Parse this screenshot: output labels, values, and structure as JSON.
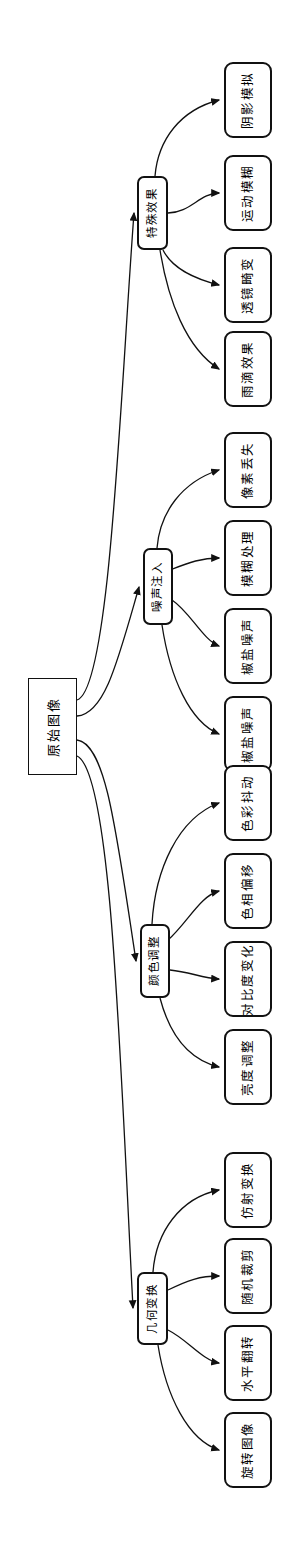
{
  "diagram": {
    "orientation": "rotated-90-ccw",
    "stroke_color": "#111111",
    "fill_color": "#ffffff",
    "root": {
      "id": "root",
      "label": "原始图像",
      "shape": "rectangle",
      "x": 28,
      "y": 678,
      "w": 49,
      "h": 97
    },
    "categories": [
      {
        "id": "cat-special-effects",
        "label": "特殊效果",
        "shape": "rounded-rectangle",
        "x": 137,
        "y": 176,
        "w": 31,
        "h": 74,
        "children": [
          {
            "id": "leaf-shadow-simulation",
            "label": "阴影模拟",
            "x": 224,
            "y": 62,
            "w": 48,
            "h": 76
          },
          {
            "id": "leaf-motion-blur",
            "label": "运动模糊",
            "x": 224,
            "y": 155,
            "w": 48,
            "h": 76
          },
          {
            "id": "leaf-lens-distortion",
            "label": "透镜畸变",
            "x": 224,
            "y": 247,
            "w": 48,
            "h": 76
          },
          {
            "id": "leaf-rain-effect",
            "label": "雨滴效果",
            "x": 224,
            "y": 331,
            "w": 48,
            "h": 76
          }
        ]
      },
      {
        "id": "cat-noise-injection",
        "label": "噪声注入",
        "shape": "rounded-rectangle",
        "x": 143,
        "y": 548,
        "w": 30,
        "h": 77,
        "children": [
          {
            "id": "leaf-pixel-loss",
            "label": "像素丢失",
            "x": 224,
            "y": 432,
            "w": 48,
            "h": 76
          },
          {
            "id": "leaf-blur-processing",
            "label": "模糊处理",
            "x": 224,
            "y": 520,
            "w": 48,
            "h": 76
          },
          {
            "id": "leaf-salt-pepper-1",
            "label": "椒盐噪声",
            "x": 224,
            "y": 608,
            "w": 48,
            "h": 76
          },
          {
            "id": "leaf-salt-pepper-2",
            "label": "椒盐噪声",
            "x": 224,
            "y": 696,
            "w": 48,
            "h": 76
          }
        ]
      },
      {
        "id": "cat-color-adjustment",
        "label": "颜色调整",
        "shape": "rounded-rectangle",
        "x": 140,
        "y": 924,
        "w": 30,
        "h": 74,
        "children": [
          {
            "id": "leaf-color-jitter",
            "label": "色彩抖动",
            "x": 224,
            "y": 765,
            "w": 48,
            "h": 76
          },
          {
            "id": "leaf-hue-shift",
            "label": "色相偏移",
            "x": 224,
            "y": 853,
            "w": 48,
            "h": 76
          },
          {
            "id": "leaf-contrast-change",
            "label": "对比度变化",
            "x": 224,
            "y": 941,
            "w": 48,
            "h": 76
          },
          {
            "id": "leaf-brightness-adjust",
            "label": "亮度调整",
            "x": 224,
            "y": 1029,
            "w": 48,
            "h": 76
          }
        ]
      },
      {
        "id": "cat-geometric-transform",
        "label": "几何变换",
        "shape": "rounded-rectangle",
        "x": 137,
        "y": 1272,
        "w": 31,
        "h": 73,
        "children": [
          {
            "id": "leaf-affine-transform",
            "label": "仿射变换",
            "x": 224,
            "y": 1152,
            "w": 48,
            "h": 76
          },
          {
            "id": "leaf-random-crop",
            "label": "随机裁剪",
            "x": 224,
            "y": 1238,
            "w": 48,
            "h": 76
          },
          {
            "id": "leaf-horizontal-flip",
            "label": "水平翻转",
            "x": 224,
            "y": 1325,
            "w": 48,
            "h": 76
          },
          {
            "id": "leaf-rotate-image",
            "label": "旋转图像",
            "x": 224,
            "y": 1412,
            "w": 48,
            "h": 76
          }
        ]
      }
    ],
    "edges": [
      {
        "from": "root",
        "to": "cat-special-effects",
        "d": "M 77 700 C 110 690, 120 400, 134 213"
      },
      {
        "from": "root",
        "to": "cat-noise-injection",
        "d": "M 77 716 C 105 714, 118 660, 139 587"
      },
      {
        "from": "root",
        "to": "cat-color-adjustment",
        "d": "M 77 740 C 106 744, 116 830, 136 961"
      },
      {
        "from": "root",
        "to": "cat-geometric-transform",
        "d": "M 77 756 C 112 772, 120 1060, 133 1308"
      },
      {
        "from": "cat-special-effects",
        "to": "leaf-shadow-simulation",
        "d": "M 155 176 C 158 140, 180 110, 219 100"
      },
      {
        "from": "cat-special-effects",
        "to": "leaf-motion-blur",
        "d": "M 168 213 C 190 213, 200 193, 219 193"
      },
      {
        "from": "cat-special-effects",
        "to": "leaf-lens-distortion",
        "d": "M 163 250 C 172 268, 192 278, 219 285"
      },
      {
        "from": "cat-special-effects",
        "to": "leaf-rain-effect",
        "d": "M 160 250 C 168 300, 186 348, 219 369"
      },
      {
        "from": "cat-noise-injection",
        "to": "leaf-pixel-loss",
        "d": "M 157 548 C 160 512, 182 482, 219 470"
      },
      {
        "from": "cat-noise-injection",
        "to": "leaf-blur-processing",
        "d": "M 170 570 C 190 562, 202 558, 219 558"
      },
      {
        "from": "cat-noise-injection",
        "to": "leaf-salt-pepper-1",
        "d": "M 172 600 C 190 612, 203 640, 219 646"
      },
      {
        "from": "cat-noise-injection",
        "to": "leaf-salt-pepper-2",
        "d": "M 162 625 C 170 678, 190 722, 219 734"
      },
      {
        "from": "cat-color-adjustment",
        "to": "leaf-color-jitter",
        "d": "M 152 924 C 155 870, 178 818, 219 803"
      },
      {
        "from": "cat-color-adjustment",
        "to": "leaf-hue-shift",
        "d": "M 168 940 C 188 922, 200 896, 219 891"
      },
      {
        "from": "cat-color-adjustment",
        "to": "leaf-contrast-change",
        "d": "M 170 970 C 190 972, 202 978, 219 979"
      },
      {
        "from": "cat-color-adjustment",
        "to": "leaf-brightness-adjust",
        "d": "M 160 998 C 170 1036, 190 1060, 219 1067"
      },
      {
        "from": "cat-geometric-transform",
        "to": "leaf-affine-transform",
        "d": "M 153 1272 C 156 1232, 180 1198, 219 1190"
      },
      {
        "from": "cat-geometric-transform",
        "to": "leaf-random-crop",
        "d": "M 168 1290 C 188 1280, 200 1276, 219 1276"
      },
      {
        "from": "cat-geometric-transform",
        "to": "leaf-horizontal-flip",
        "d": "M 168 1330 C 188 1340, 202 1360, 219 1363"
      },
      {
        "from": "cat-geometric-transform",
        "to": "leaf-rotate-image",
        "d": "M 158 1345 C 166 1396, 188 1440, 219 1450"
      }
    ]
  }
}
